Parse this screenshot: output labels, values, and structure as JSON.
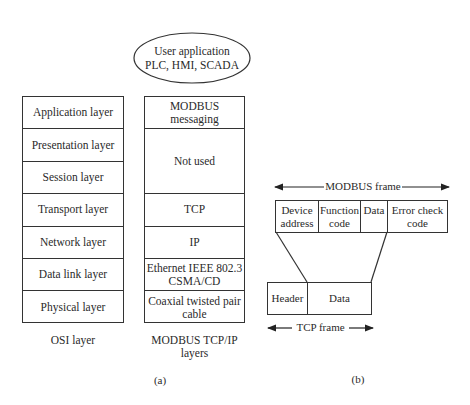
{
  "user_application": {
    "line1": "User application",
    "line2": "PLC, HMI, SCADA"
  },
  "osi_stack": {
    "caption": "OSI layer",
    "layers": [
      "Application layer",
      "Presentation layer",
      "Session layer",
      "Transport layer",
      "Network layer",
      "Data link layer",
      "Physical layer"
    ]
  },
  "modbus_stack": {
    "caption_line1": "MODBUS TCP/IP",
    "caption_line2": "layers",
    "layers": [
      {
        "label_line1": "MODBUS messaging",
        "label_line2": "",
        "span": 1
      },
      {
        "label_line1": "Not used",
        "label_line2": "",
        "span": 2
      },
      {
        "label_line1": "TCP",
        "label_line2": "",
        "span": 1
      },
      {
        "label_line1": "IP",
        "label_line2": "",
        "span": 1
      },
      {
        "label_line1": "Ethernet IEEE 802.3",
        "label_line2": "CSMA/CD",
        "span": 1
      },
      {
        "label_line1": "Coaxial twisted pair",
        "label_line2": "cable",
        "span": 1
      }
    ]
  },
  "modbus_frame": {
    "title": "MODBUS frame",
    "fields": [
      {
        "line1": "Device",
        "line2": "address"
      },
      {
        "line1": "Function",
        "line2": "code"
      },
      {
        "line1": "Data",
        "line2": ""
      },
      {
        "line1": "Error check",
        "line2": "code"
      }
    ]
  },
  "tcp_frame": {
    "title": "TCP frame",
    "fields": [
      "Header",
      "Data"
    ]
  },
  "subfigure_labels": {
    "a": "(a)",
    "b": "(b)"
  },
  "colors": {
    "line": "#333333",
    "text": "#2a2a2a",
    "background": "#ffffff"
  }
}
